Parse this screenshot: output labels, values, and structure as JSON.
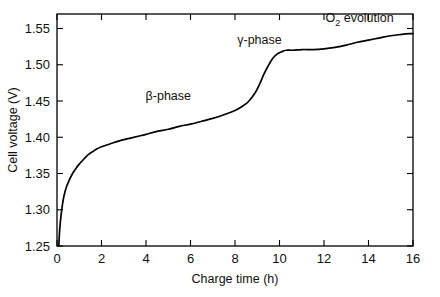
{
  "chart_data": {
    "type": "line",
    "title": "",
    "xlabel": "Charge time (h)",
    "ylabel": "Cell voltage (V)",
    "xlim": [
      0,
      16
    ],
    "ylim": [
      1.25,
      1.57
    ],
    "grid": false,
    "legend": "none",
    "xticks": [
      0,
      2,
      4,
      6,
      8,
      10,
      12,
      14,
      16
    ],
    "xtick_labels": [
      "0",
      "2",
      "4",
      "6",
      "8",
      "10",
      "12",
      "14",
      "16"
    ],
    "yticks": [
      1.25,
      1.3,
      1.35,
      1.4,
      1.45,
      1.5,
      1.55
    ],
    "ytick_labels": [
      "1.25",
      "1.30",
      "1.35",
      "1.40",
      "1.45",
      "1.50",
      "1.55"
    ],
    "series": [
      {
        "name": "charge curve",
        "color": "#000000",
        "x": [
          0.08,
          0.12,
          0.18,
          0.25,
          0.32,
          0.42,
          0.55,
          0.7,
          0.85,
          1.0,
          1.15,
          1.3,
          1.45,
          1.6,
          1.8,
          2.0,
          2.4,
          2.8,
          3.2,
          3.6,
          4.0,
          4.5,
          5.0,
          5.5,
          6.0,
          6.5,
          7.0,
          7.5,
          8.0,
          8.3,
          8.6,
          8.9,
          9.1,
          9.3,
          9.5,
          9.7,
          9.9,
          10.1,
          10.3,
          10.6,
          11.0,
          11.5,
          12.0,
          12.5,
          13.0,
          13.5,
          14.0,
          14.5,
          15.0,
          15.5,
          16.0
        ],
        "y": [
          1.25,
          1.272,
          1.292,
          1.308,
          1.32,
          1.331,
          1.341,
          1.35,
          1.357,
          1.363,
          1.368,
          1.373,
          1.377,
          1.38,
          1.384,
          1.387,
          1.391,
          1.395,
          1.398,
          1.401,
          1.404,
          1.408,
          1.411,
          1.415,
          1.418,
          1.422,
          1.426,
          1.431,
          1.437,
          1.442,
          1.449,
          1.461,
          1.473,
          1.487,
          1.499,
          1.509,
          1.515,
          1.518,
          1.52,
          1.52,
          1.521,
          1.521,
          1.522,
          1.524,
          1.527,
          1.531,
          1.534,
          1.537,
          1.54,
          1.542,
          1.543
        ]
      }
    ],
    "annotations": [
      {
        "name": "beta-phase-label",
        "text": "β-phase",
        "x": 5.0,
        "y": 1.452
      },
      {
        "name": "gamma-phase-label",
        "text": "γ-phase",
        "x": 9.1,
        "y": 1.529
      },
      {
        "name": "o2-evolution-label",
        "text_main": "O",
        "text_sub": "2",
        "text_tail": " evolution",
        "x": 13.6,
        "y": 1.559
      }
    ]
  }
}
